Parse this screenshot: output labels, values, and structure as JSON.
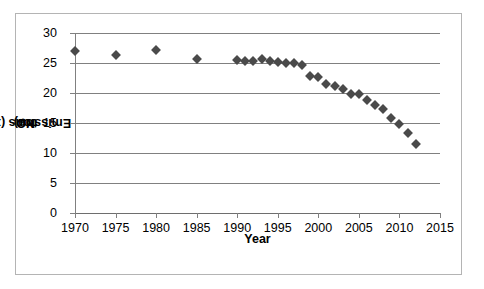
{
  "chart_data": {
    "type": "scatter",
    "title": "",
    "xlabel": "Year",
    "ylabel_parts": {
      "pre": "NO",
      "sub": "2",
      "mid": " Emissions  (x10",
      "sup": "6",
      "post": " ton)"
    },
    "ylabel": "NO2 Emissions (x10^6 ton)",
    "xlim": [
      1970,
      2015
    ],
    "ylim": [
      0,
      30
    ],
    "xticks": [
      1970,
      1975,
      1980,
      1985,
      1990,
      1995,
      2000,
      2005,
      2010,
      2015
    ],
    "yticks": [
      0,
      5,
      10,
      15,
      20,
      25,
      30
    ],
    "grid": "horizontal",
    "legend": "none",
    "marker": "diamond",
    "marker_color": "#4a4a4a",
    "x": [
      1970,
      1975,
      1980,
      1985,
      1990,
      1991,
      1992,
      1993,
      1994,
      1995,
      1996,
      1997,
      1998,
      1999,
      2000,
      2001,
      2002,
      2003,
      2004,
      2005,
      2006,
      2007,
      2008,
      2009,
      2010,
      2011,
      2012
    ],
    "values": [
      27.0,
      26.4,
      27.2,
      25.6,
      25.5,
      25.3,
      25.4,
      25.6,
      25.4,
      25.2,
      25.0,
      25.0,
      24.6,
      22.9,
      22.6,
      21.5,
      21.2,
      20.7,
      19.9,
      19.8,
      18.8,
      18.0,
      17.4,
      15.8,
      14.8,
      13.3,
      11.5
    ]
  },
  "axis": {
    "ytick_labels": [
      "0",
      "5",
      "10",
      "15",
      "20",
      "25",
      "30"
    ],
    "xtick_labels": [
      "1970",
      "1975",
      "1980",
      "1985",
      "1990",
      "1995",
      "2000",
      "2005",
      "2010",
      "2015"
    ],
    "xtitle": "Year"
  }
}
